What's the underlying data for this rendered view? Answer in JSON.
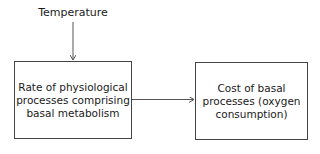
{
  "diagram": {
    "input_label": "Temperature",
    "nodes": [
      {
        "id": "rate",
        "label": "Rate of physiological processes comprising basal metabolism"
      },
      {
        "id": "cost",
        "label": "Cost of basal processes (oxygen consumption)"
      }
    ],
    "edges": [
      {
        "from": "Temperature",
        "to": "rate"
      },
      {
        "from": "rate",
        "to": "cost"
      }
    ]
  }
}
